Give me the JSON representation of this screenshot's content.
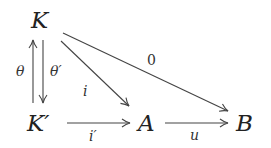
{
  "diagram": {
    "type": "commutative-diagram",
    "nodes": {
      "K": "K",
      "Kp": "K′",
      "A": "A",
      "B": "B"
    },
    "arrows": [
      {
        "from": "K'",
        "to": "K",
        "label": "θ"
      },
      {
        "from": "K",
        "to": "K'",
        "label": "θ′"
      },
      {
        "from": "K",
        "to": "A",
        "label": "i"
      },
      {
        "from": "K",
        "to": "B",
        "label": "0"
      },
      {
        "from": "K'",
        "to": "A",
        "label": "i′"
      },
      {
        "from": "A",
        "to": "B",
        "label": "u"
      }
    ],
    "labels": {
      "theta": "θ",
      "theta_prime": "θ′",
      "i": "i",
      "zero": "0",
      "i_prime": "i′",
      "u": "u"
    },
    "colors": {
      "stroke": "#444444",
      "text": "#222222"
    }
  }
}
